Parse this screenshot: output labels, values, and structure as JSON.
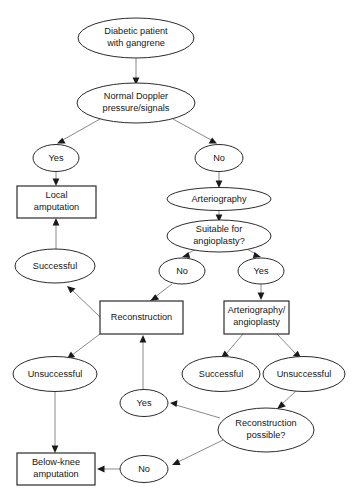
{
  "diagram": {
    "background_color": "#ffffff",
    "node_stroke_color": "#2b2b2b",
    "edge_color": "#8a8a8a",
    "text_color": "#161616",
    "nodes": [
      {
        "id": "n1",
        "shape": "ellipse",
        "lines": [
          "Diabetic patient",
          "with gangrene"
        ]
      },
      {
        "id": "n2",
        "shape": "ellipse",
        "lines": [
          "Normal Doppler",
          "pressure/signals"
        ]
      },
      {
        "id": "n3",
        "shape": "ellipse",
        "lines": [
          "Yes"
        ]
      },
      {
        "id": "n4",
        "shape": "ellipse",
        "lines": [
          "No"
        ]
      },
      {
        "id": "n5",
        "shape": "box",
        "lines": [
          "Local",
          "amputation"
        ]
      },
      {
        "id": "n6",
        "shape": "ellipse",
        "lines": [
          "Arteriography"
        ]
      },
      {
        "id": "n7",
        "shape": "ellipse",
        "lines": [
          "Suitable for",
          "angioplasty?"
        ]
      },
      {
        "id": "n8",
        "shape": "ellipse",
        "lines": [
          "Successful"
        ]
      },
      {
        "id": "n9",
        "shape": "ellipse",
        "lines": [
          "No"
        ]
      },
      {
        "id": "n10",
        "shape": "ellipse",
        "lines": [
          "Yes"
        ]
      },
      {
        "id": "n11",
        "shape": "box",
        "lines": [
          "Reconstruction"
        ]
      },
      {
        "id": "n12",
        "shape": "box",
        "lines": [
          "Arteriography/",
          "angioplasty"
        ]
      },
      {
        "id": "n13",
        "shape": "ellipse",
        "lines": [
          "Unsuccessful"
        ]
      },
      {
        "id": "n14",
        "shape": "ellipse",
        "lines": [
          "Successful"
        ]
      },
      {
        "id": "n15",
        "shape": "ellipse",
        "lines": [
          "Unsuccessful"
        ]
      },
      {
        "id": "n16",
        "shape": "ellipse",
        "lines": [
          "Yes"
        ]
      },
      {
        "id": "n17",
        "shape": "ellipse",
        "lines": [
          "Reconstruction",
          "possible?"
        ]
      },
      {
        "id": "n18",
        "shape": "box",
        "lines": [
          "Below-knee",
          "amputation"
        ]
      },
      {
        "id": "n19",
        "shape": "ellipse",
        "lines": [
          "No"
        ]
      }
    ],
    "edges": [
      {
        "from": "n1",
        "to": "n2",
        "label": ""
      },
      {
        "from": "n2",
        "to": "n3",
        "label": ""
      },
      {
        "from": "n2",
        "to": "n4",
        "label": ""
      },
      {
        "from": "n3",
        "to": "n5",
        "label": ""
      },
      {
        "from": "n4",
        "to": "n6",
        "label": ""
      },
      {
        "from": "n6",
        "to": "n7",
        "label": ""
      },
      {
        "from": "n7",
        "to": "n9",
        "label": ""
      },
      {
        "from": "n7",
        "to": "n10",
        "label": ""
      },
      {
        "from": "n8",
        "to": "n5",
        "label": ""
      },
      {
        "from": "n9",
        "to": "n11",
        "label": ""
      },
      {
        "from": "n10",
        "to": "n12",
        "label": ""
      },
      {
        "from": "n11",
        "to": "n8",
        "label": ""
      },
      {
        "from": "n11",
        "to": "n13",
        "label": ""
      },
      {
        "from": "n12",
        "to": "n14",
        "label": ""
      },
      {
        "from": "n12",
        "to": "n15",
        "label": ""
      },
      {
        "from": "n13",
        "to": "n18",
        "label": ""
      },
      {
        "from": "n15",
        "to": "n17",
        "label": ""
      },
      {
        "from": "n16",
        "to": "n11",
        "label": ""
      },
      {
        "from": "n17",
        "to": "n16",
        "label": ""
      },
      {
        "from": "n17",
        "to": "n19",
        "label": ""
      },
      {
        "from": "n19",
        "to": "n18",
        "label": ""
      }
    ]
  }
}
